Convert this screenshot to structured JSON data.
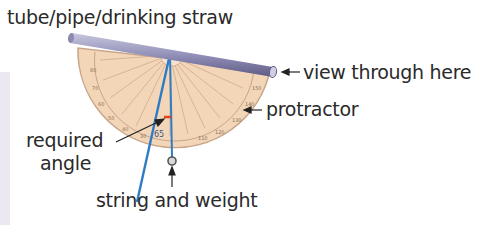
{
  "labels": {
    "tube": "tube/pipe/drinking straw",
    "view": "view through here",
    "protractor": "protractor",
    "required_angle_line1": "required",
    "required_angle_line2": "angle",
    "string": "string and weight"
  },
  "colors": {
    "protractor_fill": "#f3d6b8",
    "protractor_edge": "#c9a488",
    "tube": "#8b89b0",
    "sight_line": "#2e7cc4",
    "angle_marker": "#e8421a",
    "text": "#2a2a2a"
  }
}
